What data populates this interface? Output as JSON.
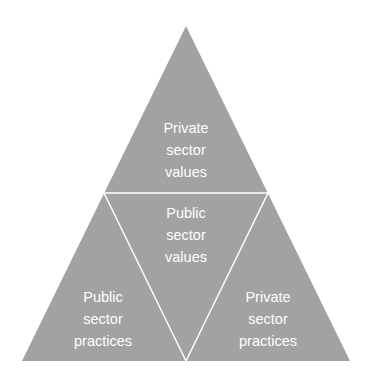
{
  "diagram": {
    "type": "triangle-pyramid",
    "fill_color": "#a2a2a2",
    "line_color": "#ffffff",
    "background": "#ffffff",
    "segments": [
      {
        "id": "top",
        "lines": [
          "Private",
          "sector",
          "values"
        ]
      },
      {
        "id": "center",
        "lines": [
          "Public",
          "sector",
          "values"
        ]
      },
      {
        "id": "bottom-left",
        "lines": [
          "Public",
          "sector",
          "practices"
        ]
      },
      {
        "id": "bottom-right",
        "lines": [
          "Private",
          "sector",
          "practices"
        ]
      }
    ]
  }
}
